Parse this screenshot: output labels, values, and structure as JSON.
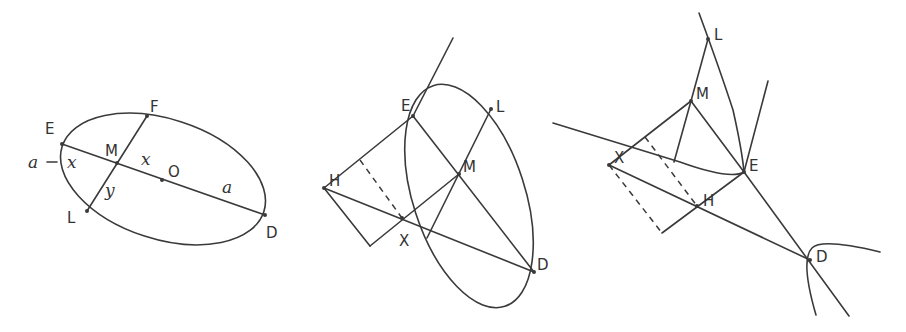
{
  "figures": [
    {
      "id": "fig1",
      "description": "Ellipse with conjugate diameters ED and FL intersecting at M, center O",
      "labels": {
        "E": "E",
        "F": "F",
        "M": "M",
        "O": "O",
        "L": "L",
        "D": "D"
      },
      "annotations": {
        "a_minus_x": "a − x",
        "x_left": "x",
        "x_right": "x",
        "y": "y",
        "a": "a"
      }
    },
    {
      "id": "fig2",
      "description": "Ellipse with tangent at E, chord ED, diameter LM, auxiliary points H and X",
      "labels": {
        "E": "E",
        "L": "L",
        "M": "M",
        "H": "H",
        "X": "X",
        "D": "D"
      }
    },
    {
      "id": "fig3",
      "description": "Hyperbola branches with points L, M, E, H, X, D",
      "labels": {
        "L": "L",
        "M": "M",
        "E": "E",
        "H": "H",
        "X": "X",
        "D": "D"
      }
    }
  ],
  "colors": {
    "stroke": "#3a3a3a",
    "background": "#ffffff",
    "text": "#333333"
  }
}
